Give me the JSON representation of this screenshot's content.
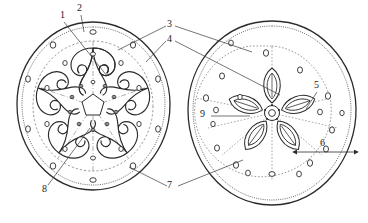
{
  "figure": {
    "kind": "technical-line-drawing",
    "background_color": "#ffffff",
    "line_color": "#2b2b2b",
    "dashed_line_color": "#6b6b6b",
    "left_disc": {
      "name": "left-disc",
      "center_x": 93,
      "center_y": 106,
      "radius_x": 77,
      "radius_y": 84,
      "inner_ring_radius_x": 60,
      "inner_ring_radius_y": 65,
      "hub_radius": 10,
      "petal_count": 5,
      "petal_style": "double-scroll-whorl",
      "hole_rings": [
        {
          "count": 10,
          "radius_x": 68,
          "radius_y": 74
        },
        {
          "count": 10,
          "radius_x": 48,
          "radius_y": 52
        },
        {
          "count": 10,
          "radius_x": 26,
          "radius_y": 28
        }
      ]
    },
    "right_disc": {
      "name": "right-disc",
      "center_x": 272,
      "center_y": 113,
      "radius_x": 84,
      "radius_y": 92,
      "inner_ring_radius_x": 74,
      "inner_ring_radius_y": 81,
      "hub_radius": 7,
      "petal_count": 5,
      "petal_style": "pointed-leaf",
      "hole_rings": [
        {
          "count": 5,
          "radius_x": 62,
          "radius_y": 67
        },
        {
          "count": 5,
          "radius_x": 46,
          "radius_y": 50
        },
        {
          "count": 5,
          "radius_x": 30,
          "radius_y": 33
        }
      ]
    }
  },
  "callouts": [
    {
      "id": "callout-1",
      "label": "1",
      "x": 62,
      "y": 13,
      "target_x": 106,
      "target_y": 74,
      "leader": true
    },
    {
      "id": "callout-2",
      "label": "2",
      "x": 79,
      "y": 6,
      "target_x": 83,
      "target_y": 31,
      "leader": true
    },
    {
      "id": "callout-3",
      "label": "3",
      "x": 169,
      "y": 22,
      "target_x": 118,
      "target_y": 50,
      "leader": true
    },
    {
      "id": "callout-4",
      "label": "4",
      "x": 169,
      "y": 37,
      "target_x": 145,
      "target_y": 61,
      "leader": true
    },
    {
      "id": "callout-5",
      "label": "5",
      "x": 316,
      "y": 83,
      "target_x": 305,
      "target_y": 108,
      "leader": true
    },
    {
      "id": "callout-6",
      "label": "6",
      "x": 322,
      "y": 141,
      "target_x": 355,
      "target_y": 152,
      "leader": true
    },
    {
      "id": "callout-7",
      "label": "7",
      "x": 169,
      "y": 183,
      "target_x": 129,
      "target_y": 166,
      "leader": true
    },
    {
      "id": "callout-8",
      "label": "8",
      "x": 44,
      "y": 187,
      "target_x": 88,
      "target_y": 130,
      "leader": true
    },
    {
      "id": "callout-9",
      "label": "9",
      "x": 202,
      "y": 112,
      "target_x": 248,
      "target_y": 118,
      "leader": true
    }
  ],
  "dimension": {
    "name": "radius-dimension-6",
    "label": "6",
    "from_x": 296,
    "from_y": 152,
    "to_x": 355,
    "to_y": 152,
    "double_arrow": true
  }
}
